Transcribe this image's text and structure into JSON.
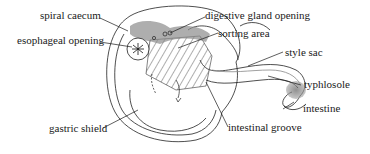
{
  "diagram": {
    "labels": {
      "spiral_caecum": "spiral caecum",
      "esophageal_opening": "esophageal opening",
      "digestive_gland_opening": "digestive gland opening",
      "sorting_area": "sorting area",
      "style_sac": "style sac",
      "typhlosole": "typhlosole",
      "intestine": "intestine",
      "intestinal_groove": "intestinal groove",
      "gastric_shield": "gastric shield"
    },
    "colors": {
      "ink": "#1a1a1a",
      "shade": "#8c8c8c",
      "background": "#ffffff"
    }
  }
}
